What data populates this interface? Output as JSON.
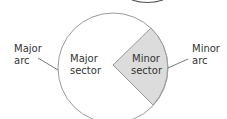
{
  "diagram": {
    "type": "circle-sectors",
    "labels": {
      "major_arc": [
        "Major",
        "arc"
      ],
      "minor_arc": [
        "Minor",
        "arc"
      ],
      "major_sector": [
        "Major",
        "sector"
      ],
      "minor_sector": [
        "Minor",
        "sector"
      ]
    },
    "colors": {
      "stroke": "#9a9a9a",
      "minor_sector_fill": "#dcdcdc",
      "text": "#333333"
    }
  }
}
